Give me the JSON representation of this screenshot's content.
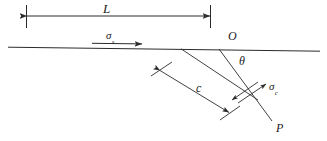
{
  "figure": {
    "background_color": "#ffffff",
    "line_color": "#2b2b2b",
    "text_color": "#1a1a1a",
    "width": 327,
    "height": 141
  },
  "labels": {
    "length_L": "L",
    "origin_O": "O",
    "angle_theta": "θ",
    "crack_length_c": "c",
    "crack_tip_P": "P",
    "driving_stress_symbol": "σ",
    "driving_stress_subscript": "s",
    "crack_stress_symbol": "σ",
    "crack_stress_subscript": "c"
  },
  "geometry": {
    "free_surface": {
      "x1": 8,
      "y1": 47,
      "x2": 320,
      "y2": 51
    },
    "dimension_L": {
      "x1": 26,
      "y1": 16,
      "x2": 210,
      "y2": 16,
      "tick_left_x": 26,
      "tick_right_x": 210,
      "tick_top": 5,
      "tick_bottom": 28
    },
    "driving_stress_arrow": {
      "x1": 92,
      "y1": 43,
      "x2": 143,
      "y2": 43
    },
    "crack_line_O_to_P": {
      "x1": 219,
      "y1": 49,
      "x2": 272,
      "y2": 121
    },
    "crack_face_upper": {
      "x1": 181,
      "y1": 49,
      "x2": 258,
      "y2": 100
    },
    "dimension_c": {
      "x1": 159,
      "y1": 70,
      "x2": 230,
      "y2": 113,
      "tick1_x1": 151,
      "tick1_y1": 76,
      "tick1_x2": 172,
      "tick1_y2": 62,
      "tick2_x1": 220,
      "tick2_y1": 120,
      "tick2_x2": 240,
      "tick2_y2": 106
    },
    "shear_couple": {
      "arrow_up_x1": 238,
      "arrow_up_y1": 103,
      "arrow_up_x2": 266,
      "arrow_up_y2": 84,
      "arrow_dn_x1": 258,
      "arrow_dn_y1": 82,
      "arrow_dn_x2": 232,
      "arrow_dn_y2": 100
    }
  }
}
